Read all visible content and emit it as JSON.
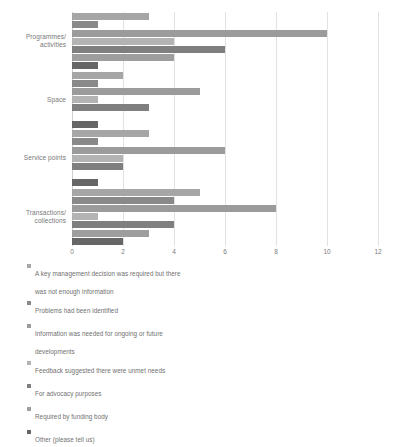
{
  "chart_data": {
    "type": "bar",
    "orientation": "horizontal",
    "title": "",
    "xlabel": "",
    "ylabel": "",
    "xlim": [
      0,
      12
    ],
    "xticks": [
      0,
      2,
      4,
      6,
      8,
      10,
      12
    ],
    "grid": true,
    "legend_position": "bottom-left",
    "categories": [
      "Programmes/\nactivities",
      "Space",
      "Service points",
      "Transactions/\ncollections"
    ],
    "series": [
      {
        "name": "A key management decision was required but there\nwas not enough information",
        "color": "#a6a6a6",
        "values": [
          3,
          2,
          3,
          5
        ]
      },
      {
        "name": "Problems had been identified",
        "color": "#898989",
        "values": [
          1,
          1,
          1,
          4
        ]
      },
      {
        "name": "Information was needed for ongoing or future\ndevelopments",
        "color": "#9b9b9b",
        "values": [
          10,
          5,
          6,
          8
        ]
      },
      {
        "name": "Feedback suggested there were unmet needs",
        "color": "#b3b3b3",
        "values": [
          4,
          1,
          2,
          1
        ]
      },
      {
        "name": "For advocacy purposes",
        "color": "#7f7f7f",
        "values": [
          6,
          3,
          2,
          4
        ]
      },
      {
        "name": "Required by funding body",
        "color": "#9e9e9e",
        "values": [
          4,
          0,
          0,
          3
        ]
      },
      {
        "name": "Other (please tell us)",
        "color": "#666666",
        "values": [
          1,
          1,
          1,
          2
        ]
      }
    ]
  },
  "axis": {
    "tick_labels": [
      "0",
      "2",
      "4",
      "6",
      "8",
      "10",
      "12"
    ]
  },
  "legend": {
    "items": [
      {
        "label": "A key management decision was required but there\nwas not enough information",
        "color": "#a6a6a6"
      },
      {
        "label": "Problems had been identified",
        "color": "#898989"
      },
      {
        "label": "Information was needed for ongoing or future\ndevelopments",
        "color": "#9b9b9b"
      },
      {
        "label": "Feedback suggested there were unmet needs",
        "color": "#b3b3b3"
      },
      {
        "label": "For advocacy purposes",
        "color": "#7f7f7f"
      },
      {
        "label": "Required by funding body",
        "color": "#9e9e9e"
      },
      {
        "label": "Other (please tell us)",
        "color": "#666666"
      }
    ]
  }
}
